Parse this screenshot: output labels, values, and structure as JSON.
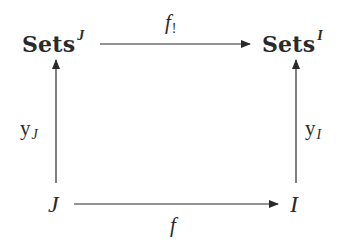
{
  "diagram": {
    "type": "commutative-square",
    "nodes": {
      "top_left": {
        "base": "Sets",
        "superscript": "J"
      },
      "top_right": {
        "base": "Sets",
        "superscript": "I"
      },
      "bottom_left": {
        "label": "J"
      },
      "bottom_right": {
        "label": "I"
      }
    },
    "arrows": {
      "top": {
        "from": "top_left",
        "to": "top_right",
        "label_base": "f",
        "label_subscript": "!"
      },
      "bottom": {
        "from": "bottom_left",
        "to": "bottom_right",
        "label_base": "f"
      },
      "left": {
        "from": "bottom_left",
        "to": "top_left",
        "label_base": "y",
        "label_subscript": "J"
      },
      "right": {
        "from": "bottom_right",
        "to": "top_right",
        "label_base": "y",
        "label_subscript": "I"
      }
    },
    "colors": {
      "ink": "#2a2a2a",
      "background": "#ffffff"
    }
  }
}
